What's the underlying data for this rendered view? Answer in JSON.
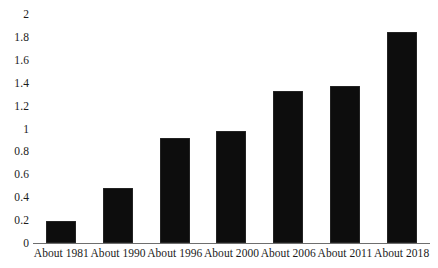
{
  "chart_data": {
    "type": "bar",
    "title": "",
    "subtitle": "",
    "xlabel": "",
    "ylabel": "",
    "categories": [
      "About 1981",
      "About 1990",
      "About 1996",
      "About 2000",
      "About 2006",
      "About 2011",
      "About 2018"
    ],
    "values": [
      0.19,
      0.48,
      0.92,
      0.98,
      1.33,
      1.37,
      1.84
    ],
    "series": [
      {
        "name": "",
        "values": [
          0.19,
          0.48,
          0.92,
          0.98,
          1.33,
          1.37,
          1.84
        ]
      }
    ],
    "ylim": [
      0,
      2
    ],
    "ytick_values": [
      0,
      0.2,
      0.4,
      0.6,
      0.8,
      1,
      1.2,
      1.4,
      1.6,
      1.8,
      2
    ],
    "ytick_labels": [
      "0",
      "0.2",
      "0.4",
      "0.6",
      "0.8",
      "1",
      "1.2",
      "1.4",
      "1.6",
      "1.8",
      "2"
    ],
    "grid": false,
    "legend": false,
    "legend_position": "none",
    "annotations": [],
    "bar_color": "#0d0d0d",
    "axis_color": "#6e6e6e",
    "text_color": "#1b1b1b",
    "background_color": "#ffffff"
  }
}
